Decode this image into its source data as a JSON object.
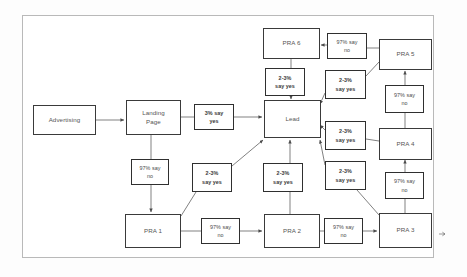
{
  "diagram": {
    "type": "flowchart",
    "nodes": [
      {
        "id": "advertising",
        "label": "Advertising",
        "x": 33,
        "y": 105,
        "w": 63,
        "h": 30
      },
      {
        "id": "landing-page",
        "label": "Landing\nPage",
        "x": 126,
        "y": 100,
        "w": 55,
        "h": 35
      },
      {
        "id": "lead",
        "label": "Lead",
        "x": 264,
        "y": 100,
        "w": 57,
        "h": 38
      },
      {
        "id": "pra-6",
        "label": "PRA 6",
        "x": 263,
        "y": 28,
        "w": 57,
        "h": 31
      },
      {
        "id": "pra-5",
        "label": "PRA 5",
        "x": 379,
        "y": 39,
        "w": 53,
        "h": 31
      },
      {
        "id": "pra-4",
        "label": "PRA 4",
        "x": 379,
        "y": 128,
        "w": 53,
        "h": 32
      },
      {
        "id": "pra-3",
        "label": "PRA 3",
        "x": 379,
        "y": 213,
        "w": 53,
        "h": 35
      },
      {
        "id": "pra-2",
        "label": "PRA 2",
        "x": 264,
        "y": 214,
        "w": 56,
        "h": 34
      },
      {
        "id": "pra-1",
        "label": "PRA 1",
        "x": 125,
        "y": 214,
        "w": 56,
        "h": 34
      }
    ],
    "edge_labels": [
      {
        "id": "lp-to-lead",
        "text": "3% say\nyes",
        "x": 194,
        "y": 104,
        "w": 40,
        "h": 26,
        "weight": "bold"
      },
      {
        "id": "lp-to-pra1",
        "text": "97% say\nno",
        "x": 131,
        "y": 159,
        "w": 38,
        "h": 26,
        "weight": "thin"
      },
      {
        "id": "pra1-to-lead",
        "text": "2-3%\nsay yes",
        "x": 192,
        "y": 163,
        "w": 40,
        "h": 29,
        "weight": "bold"
      },
      {
        "id": "pra1-to-pra2",
        "text": "97% say\nno",
        "x": 201,
        "y": 218,
        "w": 39,
        "h": 26,
        "weight": "thin"
      },
      {
        "id": "pra2-to-lead",
        "text": "2-3%\nsay yes",
        "x": 263,
        "y": 163,
        "w": 40,
        "h": 29,
        "weight": "bold"
      },
      {
        "id": "pra2-to-pra3",
        "text": "97% say\nno",
        "x": 324,
        "y": 218,
        "w": 39,
        "h": 26,
        "weight": "thin"
      },
      {
        "id": "pra3-to-lead",
        "text": "2-3%\nsay yes",
        "x": 325,
        "y": 161,
        "w": 41,
        "h": 29,
        "weight": "bold"
      },
      {
        "id": "pra3-to-pra4",
        "text": "97% say\nno",
        "x": 385,
        "y": 172,
        "w": 39,
        "h": 27,
        "weight": "thin"
      },
      {
        "id": "pra4-to-lead",
        "text": "2-3%\nsay yes",
        "x": 325,
        "y": 121,
        "w": 41,
        "h": 29,
        "weight": "bold"
      },
      {
        "id": "pra4-to-pra5",
        "text": "97% say\nno",
        "x": 385,
        "y": 85,
        "w": 39,
        "h": 28,
        "weight": "thin"
      },
      {
        "id": "pra5-to-lead",
        "text": "2-3%\nsay yes",
        "x": 325,
        "y": 70,
        "w": 41,
        "h": 29,
        "weight": "bold"
      },
      {
        "id": "pra5-to-pra6",
        "text": "97% say\nno",
        "x": 327,
        "y": 33,
        "w": 40,
        "h": 26,
        "weight": "thin"
      },
      {
        "id": "pra6-to-lead",
        "text": "2-3%\nsay yes",
        "x": 265,
        "y": 68,
        "w": 40,
        "h": 28,
        "weight": "bold"
      }
    ],
    "edges": [
      {
        "from": "advertising",
        "to": "landing-page",
        "arrow": true
      },
      {
        "from": "landing-page",
        "to": "lp-to-lead",
        "arrow": false
      },
      {
        "from": "lp-to-lead",
        "to": "lead",
        "arrow": true
      },
      {
        "from": "landing-page",
        "to": "lp-to-pra1",
        "arrow": false
      },
      {
        "from": "lp-to-pra1",
        "to": "pra-1",
        "arrow": true
      },
      {
        "from": "pra-1",
        "to": "pra1-to-lead",
        "arrow": false
      },
      {
        "from": "pra1-to-lead",
        "to": "lead",
        "arrow": true
      },
      {
        "from": "pra-1",
        "to": "pra1-to-pra2",
        "arrow": false
      },
      {
        "from": "pra1-to-pra2",
        "to": "pra-2",
        "arrow": true
      },
      {
        "from": "pra-2",
        "to": "pra2-to-lead",
        "arrow": false
      },
      {
        "from": "pra2-to-lead",
        "to": "lead",
        "arrow": true
      },
      {
        "from": "pra-2",
        "to": "pra2-to-pra3",
        "arrow": false
      },
      {
        "from": "pra2-to-pra3",
        "to": "pra-3",
        "arrow": true
      },
      {
        "from": "pra-3",
        "to": "pra3-to-lead",
        "arrow": false
      },
      {
        "from": "pra3-to-lead",
        "to": "lead",
        "arrow": true
      },
      {
        "from": "pra-3",
        "to": "pra3-to-pra4",
        "arrow": false
      },
      {
        "from": "pra3-to-pra4",
        "to": "pra-4",
        "arrow": true
      },
      {
        "from": "pra-4",
        "to": "pra4-to-lead",
        "arrow": false
      },
      {
        "from": "pra4-to-lead",
        "to": "lead",
        "arrow": true
      },
      {
        "from": "pra-4",
        "to": "pra4-to-pra5",
        "arrow": false
      },
      {
        "from": "pra4-to-pra5",
        "to": "pra-5",
        "arrow": true
      },
      {
        "from": "pra-5",
        "to": "pra5-to-lead",
        "arrow": false
      },
      {
        "from": "pra5-to-lead",
        "to": "lead",
        "arrow": true
      },
      {
        "from": "pra-5",
        "to": "pra5-to-pra6",
        "arrow": false
      },
      {
        "from": "pra5-to-pra6",
        "to": "pra-6",
        "arrow": true
      },
      {
        "from": "pra-6",
        "to": "pra6-to-lead",
        "arrow": false
      },
      {
        "from": "pra6-to-lead",
        "to": "lead",
        "arrow": true
      }
    ],
    "colors": {
      "node_border": "#3a3a3a",
      "label_border": "#2f2f2f",
      "edge": "#555555",
      "frame": "#b9b9b9",
      "background": "#ffffff",
      "text": "#555555"
    }
  }
}
